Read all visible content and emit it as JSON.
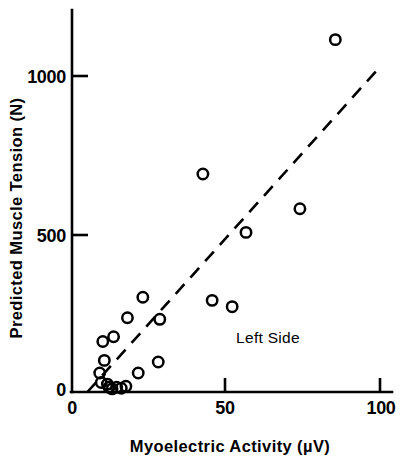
{
  "chart_data": {
    "type": "scatter",
    "title": "",
    "xlabel": "Myoelectric Activity (µV)",
    "ylabel": "Predicted Muscle Tension  (N)",
    "xlim": [
      0,
      103
    ],
    "ylim": [
      0,
      1230
    ],
    "grid": false,
    "legend": null,
    "xticks": [
      0,
      50,
      100
    ],
    "xtick_labels": [
      "0",
      "50",
      "100"
    ],
    "yticks": [
      0,
      500,
      1000
    ],
    "ytick_labels": [
      "0",
      "500",
      "1000"
    ],
    "annotations": [
      {
        "text": "Left Side",
        "x": 62,
        "y": 215
      }
    ],
    "series": [
      {
        "name": "Left Side",
        "marker": "open-circle",
        "marker_color": "#000000",
        "points": [
          {
            "x": 9.0,
            "y": 60
          },
          {
            "x": 9.5,
            "y": 30
          },
          {
            "x": 10.0,
            "y": 160
          },
          {
            "x": 10.5,
            "y": 100
          },
          {
            "x": 11.5,
            "y": 25
          },
          {
            "x": 12.0,
            "y": 15
          },
          {
            "x": 13.0,
            "y": 10
          },
          {
            "x": 13.5,
            "y": 175
          },
          {
            "x": 14.5,
            "y": 15
          },
          {
            "x": 16.0,
            "y": 12
          },
          {
            "x": 17.5,
            "y": 18
          },
          {
            "x": 18.0,
            "y": 235
          },
          {
            "x": 21.5,
            "y": 60
          },
          {
            "x": 23.0,
            "y": 300
          },
          {
            "x": 28.5,
            "y": 230
          },
          {
            "x": 28.0,
            "y": 95
          },
          {
            "x": 42.5,
            "y": 690
          },
          {
            "x": 45.5,
            "y": 290
          },
          {
            "x": 52.0,
            "y": 270
          },
          {
            "x": 56.5,
            "y": 505
          },
          {
            "x": 74.0,
            "y": 580
          },
          {
            "x": 85.5,
            "y": 1115
          }
        ]
      }
    ],
    "fit_line": {
      "style": "dashed",
      "color": "#000000",
      "x_start": 5.0,
      "y_start": 0,
      "x_end": 99.0,
      "y_end": 1018
    }
  }
}
